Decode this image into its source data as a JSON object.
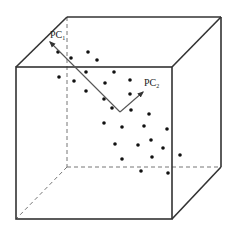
{
  "diagram": {
    "colors": {
      "edge": "#333333",
      "hidden_edge": "#777777",
      "dot": "#111111",
      "axis": "#555555"
    },
    "cube": {
      "front_face": [
        [
          16,
          67
        ],
        [
          172,
          67
        ],
        [
          172,
          219
        ],
        [
          16,
          219
        ]
      ],
      "back_face": [
        [
          67,
          17
        ],
        [
          221,
          17
        ],
        [
          221,
          167
        ],
        [
          67,
          167
        ]
      ],
      "hidden_edges": [
        "back-left-vertical",
        "back-bottom-horizontal",
        "bottom-left-depth"
      ]
    },
    "labels": {
      "pc1": {
        "text": "PC",
        "sub": "1"
      },
      "pc2": {
        "text": "PC",
        "sub": "2"
      }
    },
    "axes": {
      "origin": [
        120,
        112
      ],
      "pc1_tip": [
        50,
        42
      ],
      "pc2_tip": [
        143,
        92
      ]
    },
    "points": [
      [
        58,
        52
      ],
      [
        71,
        58
      ],
      [
        88,
        52
      ],
      [
        97,
        60
      ],
      [
        59,
        77
      ],
      [
        74,
        81
      ],
      [
        86,
        72
      ],
      [
        114,
        72
      ],
      [
        105,
        83
      ],
      [
        130,
        80
      ],
      [
        86,
        91
      ],
      [
        104,
        99
      ],
      [
        112,
        108
      ],
      [
        130,
        94
      ],
      [
        131,
        110
      ],
      [
        149,
        114
      ],
      [
        104,
        123
      ],
      [
        122,
        127
      ],
      [
        144,
        126
      ],
      [
        167,
        129
      ],
      [
        115,
        144
      ],
      [
        138,
        145
      ],
      [
        151,
        140
      ],
      [
        163,
        148
      ],
      [
        122,
        159
      ],
      [
        152,
        157
      ],
      [
        141,
        171
      ],
      [
        168,
        173
      ],
      [
        180,
        155
      ]
    ]
  }
}
